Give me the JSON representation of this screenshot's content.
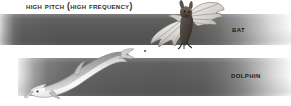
{
  "figure": {
    "title": "High pitch (high frequency)",
    "background_color": "#ffffff",
    "bands": [
      {
        "id": "bat",
        "label": "Bat",
        "animal": "bat",
        "gradient_from": "#d8d8d8",
        "gradient_mid": "#585858",
        "gradient_to": "#fbfbfb",
        "meaning": "ultrasonic echolocation frequency range"
      },
      {
        "id": "dolphin",
        "label": "Dolphin",
        "animal": "dolphin",
        "gradient_from": "#efefef",
        "gradient_mid": "#5a5a5a",
        "gradient_to": "#fcfcfc",
        "meaning": "ultrasonic echolocation frequency range"
      }
    ],
    "illustrations": [
      {
        "name": "bat-illustration",
        "alt": "Bat in flight with spread wings"
      },
      {
        "name": "dolphin-illustration",
        "alt": "Bottlenose dolphin leaping"
      }
    ],
    "colors": {
      "text": "#1c1c1c",
      "title_text": "#2b2b2b",
      "band_dark": "#585858",
      "band_light": "#ffffff"
    }
  }
}
